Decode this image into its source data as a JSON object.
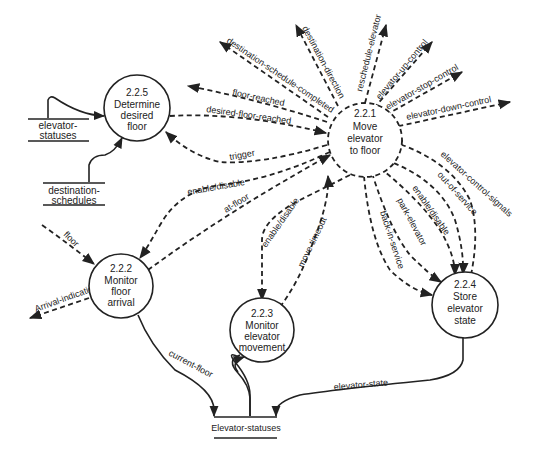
{
  "diagram": {
    "type": "data-flow-diagram",
    "processes": [
      {
        "id": "2.2.1",
        "lines": [
          "2.2.1",
          "Move",
          "elevator",
          "to floor"
        ]
      },
      {
        "id": "2.2.2",
        "lines": [
          "2.2.2",
          "Monitor",
          "floor",
          "arrival"
        ]
      },
      {
        "id": "2.2.3",
        "lines": [
          "2.2.3",
          "Monitor",
          "elevator",
          "movement"
        ]
      },
      {
        "id": "2.2.4",
        "lines": [
          "2.2.4",
          "Store",
          "elevator",
          "state"
        ]
      },
      {
        "id": "2.2.5",
        "lines": [
          "2.2.5",
          "Determine",
          "desired",
          "floor"
        ]
      }
    ],
    "stores": [
      {
        "id": "elevator-statuses-top",
        "lines": [
          "elevator-",
          "statuses"
        ]
      },
      {
        "id": "destination-schedules",
        "lines": [
          "destination-",
          "schedules"
        ]
      },
      {
        "id": "elevator-statuses-bottom",
        "lines": [
          "Elevator-statuses"
        ]
      }
    ],
    "flows": {
      "destination_schedule_completed": "destination-schedule-completed",
      "destination_direction": "destination-direction",
      "reschedule_elevator": "reschedule-elevator",
      "elevator_up_control": "elevator-up-control",
      "elevator_stop_control": "elevator-stop-control",
      "elevator_down_control": "elevator-down-control",
      "floor_reached": "floor-reached",
      "desired_floor_reached": "desired-floor-reached",
      "trigger": "trigger",
      "enable_disable_222": "enable/disable",
      "at_floor": "at-floor",
      "enable_disable_223": "enable/disable",
      "move_timeout": "move-timeout",
      "back_in_service": "back-in-service",
      "park_elevator": "park-elevator",
      "enable_disable_224": "enable/disable",
      "out_of_service": "out-of-service",
      "elevator_control_signals": "elevator-control-signals",
      "floor": "floor",
      "arrival_indication": "Arrival-indication",
      "current_floor": "current-floor",
      "elevator_state": "elevator-state"
    }
  }
}
